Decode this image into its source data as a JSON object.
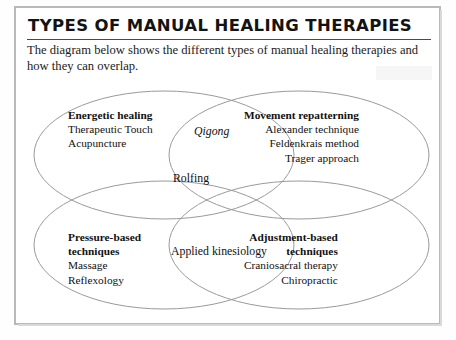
{
  "header": {
    "title": "TYPES OF MANUAL HEALING THERAPIES",
    "intro": "The diagram below shows the different types of manual healing therapies and how they can overlap."
  },
  "diagram": {
    "type": "venn",
    "set_count": 4,
    "groups": [
      {
        "id": "energetic",
        "heading": "Energetic healing",
        "items": [
          "Therapeutic Touch",
          "Acupuncture"
        ],
        "align": "left",
        "position": "top-left"
      },
      {
        "id": "movement",
        "heading": "Movement repatterning",
        "items": [
          "Alexander technique",
          "Feldenkrais method",
          "Trager approach"
        ],
        "align": "right",
        "position": "top-right"
      },
      {
        "id": "pressure",
        "heading": "Pressure-based techniques",
        "heading_line1": "Pressure-based",
        "heading_line2": "techniques",
        "items": [
          "Massage",
          "Reflexology"
        ],
        "align": "left",
        "position": "bottom-left"
      },
      {
        "id": "adjustment",
        "heading": "Adjustment-based techniques",
        "heading_line1": "Adjustment-based",
        "heading_line2": "techniques",
        "items": [
          "Craniosacral therapy",
          "Chiropractic"
        ],
        "align": "right",
        "position": "bottom-right"
      }
    ],
    "overlaps": [
      {
        "id": "qigong",
        "label": "Qigong",
        "style": "italic",
        "between": [
          "energetic",
          "movement"
        ]
      },
      {
        "id": "rolfing",
        "label": "Rolfing",
        "style": "normal",
        "between": [
          "energetic",
          "movement",
          "pressure"
        ]
      },
      {
        "id": "kinesiology",
        "label": "Applied kinesiology",
        "style": "normal",
        "between": [
          "pressure",
          "adjustment"
        ]
      }
    ]
  },
  "colors": {
    "frame_border": "#b9b9b9",
    "ellipse_stroke": "#9a9a9a",
    "rule": "#4a4a4a",
    "text": "#111111",
    "page_background": "#ffffff"
  }
}
